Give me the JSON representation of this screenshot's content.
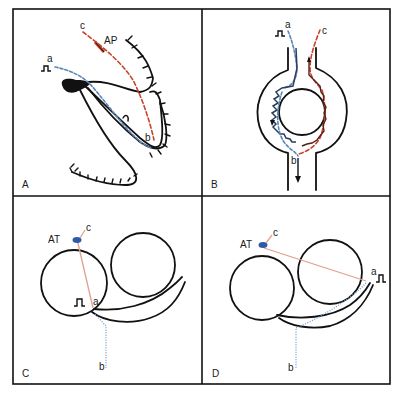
{
  "figure": {
    "type": "four-panel schematic diagram",
    "colors": {
      "frame": "#111111",
      "blue_path": "#5b86b8",
      "red_path": "#c8432a",
      "pink_line": "#e0a090",
      "electrode": "#2c5aa8"
    }
  },
  "panels": [
    {
      "id": "A",
      "label": "A",
      "annotations": {
        "a": "a",
        "b": "b",
        "c": "c",
        "ap": "AP"
      },
      "stimulus": "pulse-icon"
    },
    {
      "id": "B",
      "label": "B",
      "annotations": {
        "a": "a",
        "b": "b",
        "c": "c"
      },
      "stimulus": "pulse-icon"
    },
    {
      "id": "C",
      "label": "C",
      "annotations": {
        "a": "a",
        "b": "b",
        "c": "c",
        "at": "AT"
      },
      "stimulus": "pulse-icon"
    },
    {
      "id": "D",
      "label": "D",
      "annotations": {
        "a": "a",
        "b": "b",
        "c": "c",
        "at": "AT"
      },
      "stimulus": "pulse-icon"
    }
  ]
}
